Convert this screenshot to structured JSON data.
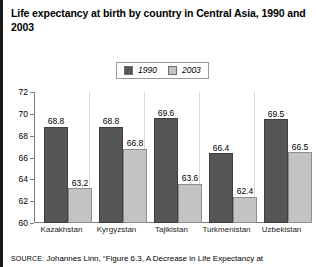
{
  "title": "Life expectancy at birth by country in Central Asia, 1990 and 2003",
  "source": {
    "prefix": "SOURCE:",
    "text": " Johannes Linn, “Figure 6.3, A Decrease in Life Expectancy at"
  },
  "legend": {
    "items": [
      {
        "label": "1990",
        "color": "#565656"
      },
      {
        "label": "2003",
        "color": "#c3c3c3"
      }
    ]
  },
  "chart_data": {
    "type": "bar",
    "title": "Life expectancy at birth by country in Central Asia, 1990 and 2003",
    "xlabel": "",
    "ylabel": "",
    "ylim": [
      60,
      72
    ],
    "yticks": [
      60,
      62,
      64,
      66,
      68,
      70,
      72
    ],
    "grid": false,
    "legend_position": "top-center",
    "categories": [
      "Kazakhstan",
      "Kyrgyzstan",
      "Tajikistan",
      "Turkmenistan",
      "Uzbekistan"
    ],
    "series": [
      {
        "name": "1990",
        "color": "#565656",
        "values": [
          68.8,
          68.8,
          69.6,
          66.4,
          69.5
        ]
      },
      {
        "name": "2003",
        "color": "#c3c3c3",
        "values": [
          63.2,
          66.8,
          63.6,
          62.4,
          66.5
        ]
      }
    ]
  }
}
